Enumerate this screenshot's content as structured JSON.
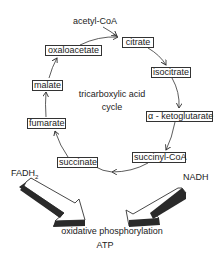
{
  "diagram": {
    "title": "tricarboxylic acid cycle",
    "center_label_line1": "tricarboxylic acid",
    "center_label_line2": "cycle",
    "input": "acetyl-CoA",
    "metabolites": [
      {
        "id": "citrate",
        "label": "citrate"
      },
      {
        "id": "isocitrate",
        "label": "isocitrate"
      },
      {
        "id": "alpha-ketoglutarate",
        "label": "α - ketoglutarate"
      },
      {
        "id": "succinyl-coa",
        "label": "succinyl-CoA"
      },
      {
        "id": "succinate",
        "label": "succinate"
      },
      {
        "id": "fumarate",
        "label": "fumarate"
      },
      {
        "id": "malate",
        "label": "malate"
      },
      {
        "id": "oxaloacetate",
        "label": "oxaloacetate"
      }
    ],
    "cofactors": {
      "fadh2_main": "FADH",
      "fadh2_sub": "2",
      "nadh": "NADH"
    },
    "output_process": "oxidative phosphorylation",
    "output_product": "ATP",
    "colors": {
      "line": "#333333",
      "arrow_face": "#ffffff",
      "arrow_shadow": "#2a2a2a",
      "text": "#222222"
    }
  }
}
